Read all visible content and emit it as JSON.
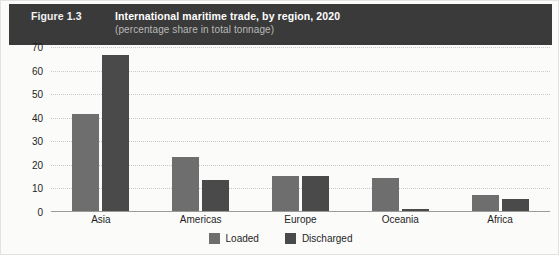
{
  "header": {
    "figure_number": "Figure 1.3",
    "title": "International maritime trade, by region, 2020",
    "subtitle": "(percentage share in total tonnage)",
    "background_color": "#3a3a3a",
    "title_color": "#ffffff",
    "subtitle_color": "#b9b9b9"
  },
  "legend": {
    "position": "bottom-center",
    "items": [
      {
        "label": "Loaded",
        "color": "#6e6e6e"
      },
      {
        "label": "Discharged",
        "color": "#4a4a4a"
      }
    ]
  },
  "axis": {
    "y_ticks": [
      "70",
      "60",
      "50",
      "40",
      "30",
      "20",
      "10",
      "0"
    ],
    "x_categories": [
      "Asia",
      "Americas",
      "Europe",
      "Oceania",
      "Africa"
    ]
  },
  "chart_data": {
    "type": "bar",
    "title": "International maritime trade, by region, 2020",
    "subtitle": "(percentage share in total tonnage)",
    "xlabel": "",
    "ylabel": "",
    "ylim": [
      0,
      70
    ],
    "ytick_step": 10,
    "grid": "horizontal-dotted",
    "legend_position": "bottom-center",
    "categories": [
      "Asia",
      "Americas",
      "Europe",
      "Oceania",
      "Africa"
    ],
    "series": [
      {
        "name": "Loaded",
        "color": "#6e6e6e",
        "values": [
          41,
          23,
          15,
          14,
          7
        ]
      },
      {
        "name": "Discharged",
        "color": "#4a4a4a",
        "values": [
          66,
          13,
          15,
          1,
          5
        ]
      }
    ]
  }
}
